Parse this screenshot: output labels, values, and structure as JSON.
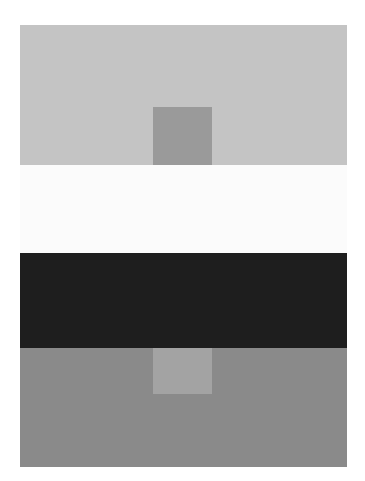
{
  "figure": {
    "type": "simultaneous-contrast-plate",
    "title": "Simultaneous contrast figure",
    "canvas": {
      "width": 365,
      "height": 481,
      "background_color": "#ffffff"
    },
    "plate": {
      "x": 20,
      "y": 25,
      "width": 327,
      "height": 442
    }
  },
  "bands": [
    {
      "name": "light-gray-band",
      "label": "Light gray surround band",
      "color": "#c4c4c4",
      "x": 20,
      "y": 25,
      "width": 327,
      "height": 140
    },
    {
      "name": "white-band",
      "label": "White surround band",
      "color": "#fbfbfb",
      "x": 20,
      "y": 165,
      "width": 327,
      "height": 88
    },
    {
      "name": "dark-band",
      "label": "Near-black surround band",
      "color": "#1e1e1e",
      "x": 20,
      "y": 253,
      "width": 327,
      "height": 95
    },
    {
      "name": "medium-gray-band",
      "label": "Medium gray surround band",
      "color": "#8a8a8a",
      "x": 20,
      "y": 348,
      "width": 327,
      "height": 119
    }
  ],
  "patches": [
    {
      "name": "upper-patch",
      "label": "Upper test patch",
      "color": "#9a9a9a",
      "x": 153,
      "y": 107,
      "width": 59,
      "height": 58,
      "surround": "light-gray-band"
    },
    {
      "name": "lower-patch",
      "label": "Lower test patch",
      "color": "#a3a3a3",
      "x": 153,
      "y": 348,
      "width": 59,
      "height": 46,
      "surround": "medium-gray-band"
    }
  ]
}
